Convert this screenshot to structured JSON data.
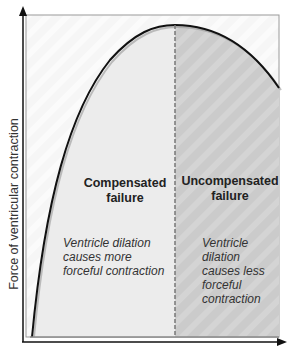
{
  "diagram": {
    "y_axis_label": "Force of ventricular contraction",
    "regions": [
      {
        "title": "Compensated failure",
        "title_lines": [
          "Compensated",
          "failure"
        ],
        "description_lines": [
          "Ventricle dilation",
          "causes more",
          "forceful contraction"
        ],
        "fill_color": "#ececec"
      },
      {
        "title": "Uncompensated failure",
        "title_lines": [
          "Uncompensated",
          "failure"
        ],
        "description_lines": [
          "Ventricle",
          "dilation",
          "causes less",
          "forceful",
          "contraction"
        ],
        "fill_color": "#cfcfcf"
      }
    ],
    "divider_style": "dashed",
    "curve": "rises steeply, peaks at divider, then declines",
    "colors": {
      "background": "#f7f7f7",
      "left_fill": "#ececec",
      "right_fill": "#cfcfcf",
      "curve": "#111111",
      "axis": "#111111",
      "divider": "#777777"
    }
  }
}
